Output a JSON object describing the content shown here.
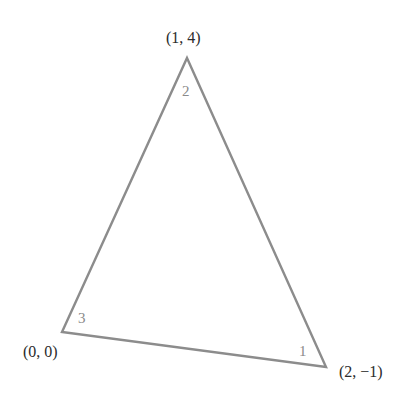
{
  "diagram": {
    "type": "triangle",
    "stroke_color": "#8c8c8c",
    "vertices": [
      {
        "id": "A",
        "coords_label": "(0, 0)",
        "x": 0,
        "y": 0
      },
      {
        "id": "B",
        "coords_label": "(2, −1)",
        "x": 2,
        "y": -1
      },
      {
        "id": "C",
        "coords_label": "(1, 4)",
        "x": 1,
        "y": 4
      }
    ],
    "angle_labels": [
      {
        "vertex": "(2, −1)",
        "label": "1"
      },
      {
        "vertex": "(1, 4)",
        "label": "2"
      },
      {
        "vertex": "(0, 0)",
        "label": "3"
      }
    ]
  }
}
